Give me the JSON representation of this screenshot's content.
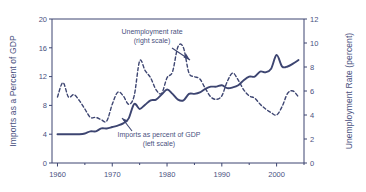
{
  "chart_data": {
    "type": "line",
    "title": "",
    "subtitle": "",
    "xlabel": "",
    "ylabel": "Imports as a Percent of GDP",
    "y2label": "Unemployment Rate (percent)",
    "xlim": [
      1959,
      2005
    ],
    "ylim": [
      0,
      20
    ],
    "y2lim": [
      0,
      12
    ],
    "grid": false,
    "legend_position": "inline-annotations",
    "xticks": [
      1960,
      1970,
      1980,
      1990,
      2000
    ],
    "xtick_labels": [
      "1960",
      "1970",
      "1980",
      "1990",
      "2000"
    ],
    "xminorticks": [
      1965,
      1975,
      1985,
      1995,
      2005
    ],
    "yticks": [
      0,
      4,
      8,
      12,
      16,
      20
    ],
    "ytick_labels": [
      "0",
      "4",
      "8",
      "12",
      "16",
      "20"
    ],
    "y2ticks": [
      0,
      2,
      4,
      6,
      8,
      10,
      12
    ],
    "y2tick_labels": [
      "0",
      "2",
      "4",
      "6",
      "8",
      "10",
      "12"
    ],
    "annotations": [
      {
        "name": "unemployment-annotation",
        "line1": "Unemployment rate",
        "line2": "(right scale)"
      },
      {
        "name": "imports-annotation",
        "line1": "Imports as percent of GDP",
        "line2": "(left scale)"
      }
    ],
    "series": [
      {
        "name": "Imports as percent of GDP",
        "axis": "left",
        "style": "solid",
        "color": "#3d4571",
        "x": [
          1960,
          1961,
          1962,
          1963,
          1964,
          1965,
          1966,
          1967,
          1968,
          1969,
          1970,
          1971,
          1972,
          1973,
          1974,
          1975,
          1976,
          1977,
          1978,
          1979,
          1980,
          1981,
          1982,
          1983,
          1984,
          1985,
          1986,
          1987,
          1988,
          1989,
          1990,
          1991,
          1992,
          1993,
          1994,
          1995,
          1996,
          1997,
          1998,
          1999,
          2000,
          2001,
          2002,
          2003,
          2004
        ],
        "values": [
          4.0,
          4.0,
          4.0,
          4.0,
          4.0,
          4.1,
          4.4,
          4.4,
          4.8,
          4.8,
          5.0,
          5.2,
          5.5,
          6.2,
          8.2,
          7.5,
          8.1,
          8.7,
          8.8,
          9.5,
          10.2,
          9.6,
          8.8,
          8.7,
          9.6,
          9.6,
          9.8,
          10.3,
          10.6,
          10.6,
          10.8,
          10.4,
          10.5,
          10.8,
          11.5,
          12.0,
          12.0,
          12.7,
          12.6,
          13.1,
          15.0,
          13.4,
          13.4,
          13.8,
          14.3
        ]
      },
      {
        "name": "Unemployment rate",
        "axis": "right",
        "style": "dashed",
        "color": "#3d4571",
        "x": [
          1960,
          1961,
          1962,
          1963,
          1964,
          1965,
          1966,
          1967,
          1968,
          1969,
          1970,
          1971,
          1972,
          1973,
          1974,
          1975,
          1976,
          1977,
          1978,
          1979,
          1980,
          1981,
          1982,
          1983,
          1984,
          1985,
          1986,
          1987,
          1988,
          1989,
          1990,
          1991,
          1992,
          1993,
          1994,
          1995,
          1996,
          1997,
          1998,
          1999,
          2000,
          2001,
          2002,
          2003,
          2004
        ],
        "values": [
          5.5,
          6.7,
          5.5,
          5.7,
          5.2,
          4.5,
          3.8,
          3.8,
          3.6,
          3.5,
          4.9,
          5.9,
          5.6,
          4.9,
          5.6,
          8.5,
          7.7,
          7.1,
          6.1,
          5.8,
          7.1,
          7.6,
          9.7,
          9.6,
          7.5,
          7.2,
          7.0,
          6.2,
          5.5,
          5.3,
          5.6,
          6.8,
          7.5,
          6.9,
          6.1,
          5.6,
          5.4,
          4.9,
          4.5,
          4.2,
          4.0,
          4.7,
          5.8,
          6.0,
          5.5
        ]
      }
    ]
  },
  "layout": {
    "plot_left": 52,
    "plot_right": 304,
    "plot_top": 19,
    "plot_bottom": 163
  }
}
